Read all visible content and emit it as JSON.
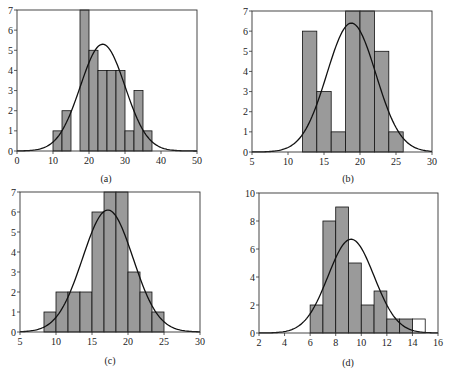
{
  "figure": {
    "background": "#ffffff",
    "bar_fill": "#9a9a9a",
    "bar_stroke": "#111111",
    "curve_color": "#111111"
  },
  "chart_data": [
    {
      "type": "bar",
      "panel_label": "(a)",
      "title": "",
      "xlabel": "",
      "ylabel": "",
      "bin_edges": [
        10,
        12.5,
        15,
        17.5,
        20,
        22.5,
        25,
        27.5,
        30,
        32.5,
        35,
        37.5
      ],
      "values": [
        1,
        2,
        0,
        7,
        5,
        4,
        4,
        4,
        1,
        3,
        1
      ],
      "xlim": [
        0,
        50
      ],
      "ylim": [
        0,
        7
      ],
      "xticks": [
        0,
        10,
        20,
        30,
        40,
        50
      ],
      "yticks": [
        0,
        1,
        2,
        3,
        4,
        5,
        6,
        7
      ],
      "normal_curve": {
        "mean": 23.8,
        "sd": 6.2,
        "peak": 5.3
      },
      "grid": false,
      "box": {
        "left": 17,
        "right": 197,
        "top": 10,
        "bottom": 151
      },
      "label_pos": {
        "x": 106,
        "y": 182
      }
    },
    {
      "type": "bar",
      "panel_label": "(b)",
      "title": "",
      "xlabel": "",
      "ylabel": "",
      "bin_edges": [
        12,
        14,
        16,
        18,
        20,
        22,
        24,
        26
      ],
      "values": [
        6,
        3,
        1,
        7,
        7,
        5,
        1
      ],
      "xlim": [
        5,
        30
      ],
      "ylim": [
        0,
        7
      ],
      "xticks": [
        5,
        10,
        15,
        20,
        25,
        30
      ],
      "yticks": [
        0,
        1,
        2,
        3,
        4,
        5,
        6,
        7
      ],
      "normal_curve": {
        "mean": 18.8,
        "sd": 3.4,
        "peak": 6.4
      },
      "grid": false,
      "box": {
        "left": 252,
        "right": 432,
        "top": 11,
        "bottom": 152
      },
      "label_pos": {
        "x": 348,
        "y": 182
      }
    },
    {
      "type": "bar",
      "panel_label": "(c)",
      "title": "",
      "xlabel": "",
      "ylabel": "",
      "bin_edges": [
        8.33,
        10,
        11.67,
        13.33,
        15,
        16.67,
        18.33,
        20,
        21.67,
        23.33,
        25
      ],
      "values": [
        1,
        2,
        2,
        2,
        6,
        7,
        7,
        3,
        2,
        1
      ],
      "xlim": [
        5,
        30
      ],
      "ylim": [
        0,
        7
      ],
      "xticks": [
        5,
        10,
        15,
        20,
        25,
        30
      ],
      "yticks": [
        0,
        1,
        2,
        3,
        4,
        5,
        6,
        7
      ],
      "normal_curve": {
        "mean": 17.2,
        "sd": 3.5,
        "peak": 6.1
      },
      "grid": false,
      "box": {
        "left": 20,
        "right": 200,
        "top": 192,
        "bottom": 332
      },
      "label_pos": {
        "x": 110,
        "y": 364
      }
    },
    {
      "type": "bar",
      "panel_label": "(d)",
      "title": "",
      "xlabel": "",
      "ylabel": "",
      "bin_edges": [
        6,
        7,
        8,
        9,
        10,
        11,
        12,
        13,
        14,
        15
      ],
      "values": [
        2,
        8,
        9,
        5,
        2,
        3,
        1,
        1,
        1
      ],
      "highlight_white_bins": [
        8
      ],
      "xlim": [
        2,
        16
      ],
      "ylim": [
        0,
        10
      ],
      "xticks": [
        2,
        4,
        6,
        8,
        10,
        12,
        14,
        16
      ],
      "yticks": [
        0,
        2,
        4,
        6,
        8,
        10
      ],
      "normal_curve": {
        "mean": 9.2,
        "sd": 1.8,
        "peak": 6.7
      },
      "grid": false,
      "box": {
        "left": 259,
        "right": 438,
        "top": 193,
        "bottom": 333
      },
      "label_pos": {
        "x": 348,
        "y": 366
      }
    }
  ]
}
